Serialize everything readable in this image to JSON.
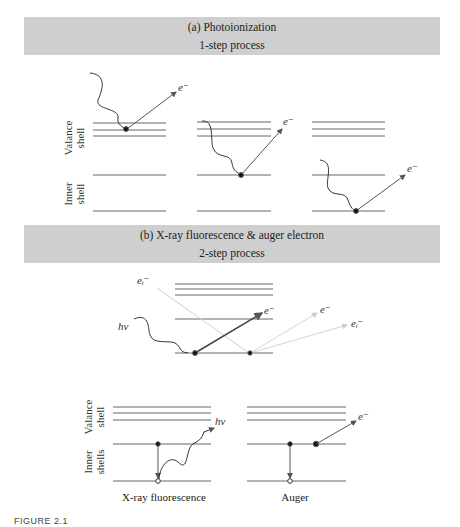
{
  "panel_a": {
    "title": "(a) Photoionization",
    "subtitle": "1-step process",
    "shell_labels": {
      "valance": [
        "Valance",
        "shell"
      ],
      "inner": [
        "Inner",
        "shell"
      ]
    },
    "electron_label": "e⁻"
  },
  "panel_b": {
    "title": "(b) X-ray fluorescence & auger electron",
    "subtitle": "2-step process",
    "incident_label": "hν",
    "incident_electron_label": "eᵢ⁻",
    "electron_label": "e⁻",
    "shell_labels": {
      "valance": [
        "Valance",
        "shell"
      ],
      "inner": [
        "Inner",
        "shells"
      ]
    },
    "emitted_photon_label": "hν",
    "captions": {
      "fluorescence": "X-ray fluorescence",
      "auger": "Auger"
    }
  },
  "figure_label": "FIGURE 2.1",
  "colors": {
    "band": "#cfcfcf",
    "line": "#555555",
    "faint": "#cccccc"
  }
}
